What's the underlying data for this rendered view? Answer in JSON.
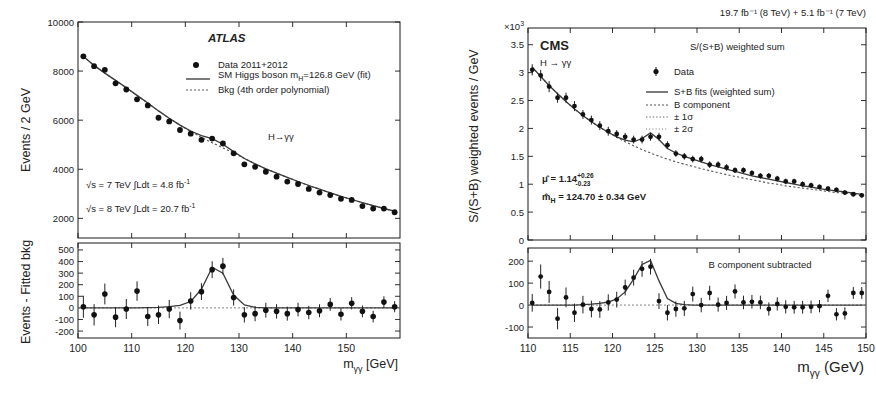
{
  "figure": {
    "caption_absent": true
  },
  "atlas": {
    "experiment": "ATLAS",
    "channel": "H→γγ",
    "lumi7": "√s = 7 TeV  ∫Ldt = 4.8 fb",
    "lumi7_sup": "-1",
    "lumi8": "√s = 8 TeV  ∫Ldt = 20.7 fb",
    "lumi8_sup": "-1",
    "legend": [
      {
        "marker": "point",
        "label": "Data 2011+2012"
      },
      {
        "marker": "line",
        "label": "SM Higgs boson m_H=126.8 GeV (fit)"
      },
      {
        "marker": "dotted",
        "label": "Bkg (4th order polynomial)"
      }
    ],
    "legend_line2_pre": "SM Higgs boson m",
    "legend_line2_sub": "H",
    "legend_line2_post": "=126.8 GeV (fit)",
    "top": {
      "ylabel": "Events / 2 GeV",
      "yticks": [
        "2000",
        "4000",
        "6000",
        "8000",
        "10000"
      ],
      "ytick_values": [
        2000,
        4000,
        6000,
        8000,
        10000
      ],
      "ylim": [
        1200,
        10000
      ]
    },
    "bottom": {
      "ylabel": "Events - Fitted bkg",
      "yticks": [
        "-200",
        "-100",
        "0",
        "100",
        "200",
        "300",
        "400",
        "500"
      ],
      "ytick_values": [
        -200,
        -100,
        0,
        100,
        200,
        300,
        400,
        500
      ],
      "ylim": [
        -260,
        560
      ]
    },
    "xlabel_pre": "m",
    "xlabel_sub": "γγ",
    "xlabel_post": " [GeV]",
    "xticks": [
      "100",
      "110",
      "120",
      "130",
      "140",
      "150"
    ],
    "xtick_values": [
      100,
      110,
      120,
      130,
      140,
      150
    ],
    "xlim": [
      100,
      160
    ]
  },
  "cms": {
    "experiment": "CMS",
    "channel": "H → γγ",
    "lumi_header": "19.7 fb⁻¹ (8 TeV) + 5.1 fb⁻¹ (7 TeV)",
    "weight_note": "S/(S+B) weighted sum",
    "scale_pre": "×10",
    "scale_sup": "3",
    "legend": [
      {
        "marker": "point",
        "label": "Data"
      },
      {
        "marker": "line",
        "label": "S+B fits (weighted sum)"
      },
      {
        "marker": "dash",
        "label": "B component"
      },
      {
        "marker": "dot1",
        "label": "± 1σ"
      },
      {
        "marker": "dot2",
        "label": "± 2σ"
      }
    ],
    "fit_mu_pre": "μ̂  = 1.14",
    "fit_mu_sup": "+0.26",
    "fit_mu_sub": "-0.23",
    "fit_mass_pre": "m̂",
    "fit_mass_sub": "H",
    "fit_mass_post": " = 124.70 ± 0.34 GeV",
    "subtract_note": "B component subtracted",
    "top": {
      "ylabel": "S/(S+B) weighted events / GeV",
      "yticks": [
        "0",
        "0.5",
        "1",
        "1.5",
        "2",
        "2.5",
        "3",
        "3.5"
      ],
      "ytick_values": [
        0,
        0.5,
        1,
        1.5,
        2,
        2.5,
        3,
        3.5
      ],
      "ylim": [
        0,
        3.8
      ]
    },
    "bottom": {
      "yticks": [
        "-100",
        "0",
        "100",
        "200"
      ],
      "ytick_values": [
        -100,
        0,
        100,
        200
      ],
      "ylim": [
        -150,
        260
      ]
    },
    "xlabel_pre": "m",
    "xlabel_sub": "γγ",
    "xlabel_post": " (GeV)",
    "xticks": [
      "110",
      "115",
      "120",
      "125",
      "130",
      "135",
      "140",
      "145",
      "150"
    ],
    "xtick_values": [
      110,
      115,
      120,
      125,
      130,
      135,
      140,
      145,
      150
    ],
    "xlim": [
      110,
      150
    ]
  },
  "chart_data": [
    {
      "type": "scatter",
      "title": "ATLAS H→γγ invariant mass spectrum",
      "xlabel": "m_γγ [GeV]",
      "ylabel": "Events / 2 GeV",
      "xlim": [
        100,
        160
      ],
      "ylim": [
        1200,
        10000
      ],
      "grid": false,
      "legend_position": "top-right",
      "x": [
        101,
        103,
        105,
        107,
        109,
        111,
        113,
        115,
        117,
        119,
        121,
        123,
        125,
        127,
        129,
        131,
        133,
        135,
        137,
        139,
        141,
        143,
        145,
        147,
        149,
        151,
        153,
        155,
        157,
        159
      ],
      "series": [
        {
          "name": "Data 2011+2012",
          "values": [
            8600,
            8200,
            8050,
            7500,
            7250,
            6850,
            6600,
            6100,
            5950,
            5600,
            5450,
            5200,
            5250,
            5050,
            4650,
            4200,
            4100,
            3900,
            3700,
            3500,
            3400,
            3200,
            3050,
            2950,
            2800,
            2750,
            2500,
            2400,
            2400,
            2250
          ],
          "errors": [
            95,
            92,
            90,
            88,
            86,
            84,
            82,
            80,
            79,
            77,
            75,
            73,
            73,
            72,
            70,
            66,
            65,
            64,
            62,
            60,
            59,
            58,
            56,
            55,
            54,
            53,
            51,
            50,
            50,
            48
          ]
        },
        {
          "name": "SM Higgs boson m_H=126.8 GeV (fit)",
          "values": [
            8600,
            8230,
            7920,
            7620,
            7320,
            7010,
            6700,
            6380,
            6080,
            5800,
            5560,
            5370,
            5250,
            5020,
            4720,
            4440,
            4220,
            4020,
            3840,
            3670,
            3500,
            3340,
            3190,
            3040,
            2900,
            2770,
            2640,
            2520,
            2400,
            2290
          ]
        },
        {
          "name": "Bkg (4th order polynomial)",
          "values": [
            8600,
            8230,
            7920,
            7620,
            7320,
            7010,
            6700,
            6380,
            6080,
            5800,
            5540,
            5300,
            5080,
            4870,
            4670,
            4440,
            4220,
            4020,
            3840,
            3670,
            3500,
            3340,
            3190,
            3040,
            2900,
            2770,
            2640,
            2520,
            2400,
            2290
          ]
        }
      ]
    },
    {
      "type": "scatter",
      "title": "ATLAS residuals: Events - Fitted bkg",
      "xlabel": "m_γγ [GeV]",
      "ylabel": "Events - Fitted bkg",
      "xlim": [
        100,
        160
      ],
      "ylim": [
        -260,
        560
      ],
      "grid": false,
      "x": [
        101,
        103,
        105,
        107,
        109,
        111,
        113,
        115,
        117,
        119,
        121,
        123,
        125,
        127,
        129,
        131,
        133,
        135,
        137,
        139,
        141,
        143,
        145,
        147,
        149,
        151,
        153,
        155,
        157,
        159
      ],
      "series": [
        {
          "name": "Data - fitted bkg",
          "values": [
            10,
            -60,
            120,
            -80,
            -10,
            145,
            -75,
            -60,
            -10,
            -110,
            60,
            140,
            330,
            360,
            90,
            -60,
            -50,
            -20,
            -30,
            -50,
            -15,
            -40,
            -25,
            30,
            -55,
            40,
            -30,
            -75,
            50,
            10
          ],
          "errors": [
            95,
            92,
            90,
            88,
            86,
            84,
            82,
            80,
            79,
            77,
            75,
            73,
            73,
            72,
            70,
            66,
            65,
            64,
            62,
            60,
            59,
            58,
            56,
            55,
            54,
            53,
            51,
            50,
            50,
            48
          ]
        },
        {
          "name": "Signal fit",
          "values": [
            0,
            0,
            0,
            0,
            0,
            0,
            2,
            5,
            10,
            22,
            55,
            160,
            350,
            300,
            110,
            25,
            5,
            0,
            0,
            0,
            0,
            0,
            0,
            0,
            0,
            0,
            0,
            0,
            0,
            0
          ]
        }
      ]
    },
    {
      "type": "scatter",
      "title": "CMS S/(S+B) weighted diphoton mass spectrum",
      "xlabel": "m_γγ (GeV)",
      "ylabel": "S/(S+B) weighted events / GeV",
      "y_scale": 1000,
      "xlim": [
        110,
        150
      ],
      "ylim": [
        0,
        3.8
      ],
      "grid": false,
      "legend_position": "top-right",
      "x": [
        110.5,
        111.5,
        112.5,
        113.5,
        114.5,
        115.5,
        116.5,
        117.5,
        118.5,
        119.5,
        120.5,
        121.5,
        122.5,
        123.5,
        124.5,
        125.5,
        126.5,
        127.5,
        128.5,
        129.5,
        130.5,
        131.5,
        132.5,
        133.5,
        134.5,
        135.5,
        136.5,
        137.5,
        138.5,
        139.5,
        140.5,
        141.5,
        142.5,
        143.5,
        144.5,
        145.5,
        146.5,
        147.5,
        148.5,
        149.5
      ],
      "series": [
        {
          "name": "Data",
          "values": [
            3.05,
            2.95,
            2.75,
            2.55,
            2.55,
            2.4,
            2.25,
            2.15,
            2.05,
            1.95,
            1.9,
            1.85,
            1.8,
            1.8,
            1.85,
            1.85,
            1.7,
            1.55,
            1.5,
            1.45,
            1.45,
            1.35,
            1.35,
            1.3,
            1.25,
            1.25,
            1.2,
            1.15,
            1.15,
            1.1,
            1.05,
            1.05,
            1.0,
            0.98,
            0.95,
            0.92,
            0.9,
            0.85,
            0.82,
            0.8
          ],
          "errors": [
            0.1,
            0.1,
            0.1,
            0.09,
            0.09,
            0.09,
            0.08,
            0.08,
            0.08,
            0.08,
            0.07,
            0.07,
            0.07,
            0.07,
            0.07,
            0.07,
            0.07,
            0.06,
            0.06,
            0.06,
            0.06,
            0.06,
            0.06,
            0.06,
            0.05,
            0.05,
            0.05,
            0.05,
            0.05,
            0.05,
            0.05,
            0.05,
            0.05,
            0.05,
            0.04,
            0.04,
            0.04,
            0.04,
            0.04,
            0.04
          ]
        },
        {
          "name": "S+B fits (weighted sum)",
          "values": [
            3.1,
            2.93,
            2.77,
            2.62,
            2.48,
            2.35,
            2.23,
            2.12,
            2.02,
            1.93,
            1.85,
            1.79,
            1.76,
            1.82,
            1.92,
            1.8,
            1.64,
            1.56,
            1.5,
            1.45,
            1.4,
            1.35,
            1.31,
            1.27,
            1.23,
            1.19,
            1.15,
            1.12,
            1.09,
            1.06,
            1.03,
            1.0,
            0.97,
            0.95,
            0.92,
            0.9,
            0.88,
            0.86,
            0.84,
            0.82
          ]
        },
        {
          "name": "B component",
          "values": [
            3.1,
            2.93,
            2.77,
            2.62,
            2.48,
            2.35,
            2.23,
            2.12,
            2.02,
            1.93,
            1.84,
            1.76,
            1.69,
            1.62,
            1.56,
            1.5,
            1.45,
            1.4,
            1.36,
            1.32,
            1.28,
            1.24,
            1.21,
            1.17,
            1.14,
            1.11,
            1.08,
            1.05,
            1.02,
            1.0,
            0.97,
            0.95,
            0.93,
            0.91,
            0.89,
            0.87,
            0.85,
            0.84,
            0.82,
            0.8
          ]
        }
      ]
    },
    {
      "type": "scatter",
      "title": "CMS residuals: B component subtracted",
      "xlabel": "m_γγ (GeV)",
      "ylabel": "",
      "xlim": [
        110,
        150
      ],
      "ylim": [
        -150,
        260
      ],
      "grid": false,
      "x": [
        110.5,
        111.5,
        112.5,
        113.5,
        114.5,
        115.5,
        116.5,
        117.5,
        118.5,
        119.5,
        120.5,
        121.5,
        122.5,
        123.5,
        124.5,
        125.5,
        126.5,
        127.5,
        128.5,
        129.5,
        130.5,
        131.5,
        132.5,
        133.5,
        134.5,
        135.5,
        136.5,
        137.5,
        138.5,
        139.5,
        140.5,
        141.5,
        142.5,
        143.5,
        144.5,
        145.5,
        146.5,
        147.5,
        148.5,
        149.5
      ],
      "series": [
        {
          "name": "Data - B component",
          "values": [
            10,
            130,
            60,
            -62,
            35,
            -35,
            2,
            -18,
            -20,
            12,
            25,
            80,
            125,
            165,
            175,
            18,
            -35,
            -18,
            -15,
            50,
            0,
            55,
            2,
            10,
            62,
            12,
            15,
            12,
            -18,
            5,
            -8,
            -10,
            -10,
            -8,
            -5,
            42,
            -42,
            -38,
            55,
            55
          ],
          "errors": [
            40,
            55,
            50,
            48,
            45,
            42,
            40,
            38,
            38,
            37,
            36,
            36,
            36,
            36,
            36,
            36,
            35,
            35,
            34,
            34,
            33,
            33,
            32,
            32,
            32,
            31,
            31,
            31,
            30,
            30,
            30,
            29,
            29,
            29,
            28,
            28,
            28,
            28,
            27,
            27
          ]
        },
        {
          "name": "Signal fit",
          "values": [
            0,
            0,
            0,
            0,
            0,
            0,
            2,
            4,
            8,
            14,
            28,
            60,
            118,
            185,
            203,
            110,
            30,
            8,
            2,
            0,
            0,
            0,
            0,
            0,
            0,
            0,
            0,
            0,
            0,
            0,
            0,
            0,
            0,
            0,
            0,
            0,
            0,
            0,
            0,
            0
          ]
        }
      ]
    }
  ]
}
